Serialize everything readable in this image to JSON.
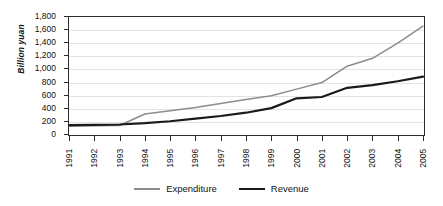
{
  "chart_data": {
    "type": "line",
    "title": "",
    "xlabel": "",
    "ylabel": "Billion yuan",
    "categories": [
      "1991",
      "1992",
      "1993",
      "1994",
      "1995",
      "1996",
      "1997",
      "1998",
      "1999",
      "2000",
      "2001",
      "2002",
      "2003",
      "2004",
      "2005"
    ],
    "x": [
      1991,
      1992,
      1993,
      1994,
      1995,
      1996,
      1997,
      1998,
      1999,
      2000,
      2001,
      2002,
      2003,
      2004,
      2005
    ],
    "ylim": [
      0,
      1800
    ],
    "ytick_labels": [
      "0",
      "200",
      "400",
      "600",
      "800",
      "1,000",
      "1,200",
      "1,400",
      "1,600",
      "1,800"
    ],
    "ytick_values": [
      0,
      200,
      400,
      600,
      800,
      1000,
      1200,
      1400,
      1600,
      1800
    ],
    "grid": true,
    "legend_position": "bottom",
    "series": [
      {
        "name": "Expenditure",
        "color": "#8c8c8c",
        "width": 1.5,
        "values": [
          135,
          140,
          145,
          320,
          370,
          420,
          480,
          540,
          600,
          700,
          800,
          1050,
          1170,
          1400,
          1660
        ]
      },
      {
        "name": "Revenue",
        "color": "#1a1a1a",
        "width": 2.2,
        "values": [
          150,
          155,
          160,
          180,
          210,
          250,
          290,
          340,
          410,
          560,
          580,
          720,
          760,
          820,
          890
        ]
      }
    ]
  },
  "axis": {
    "y_title": "Billion yuan"
  },
  "legend": {
    "items": [
      {
        "label": "Expenditure",
        "color": "#8c8c8c"
      },
      {
        "label": "Revenue",
        "color": "#1a1a1a"
      }
    ]
  }
}
